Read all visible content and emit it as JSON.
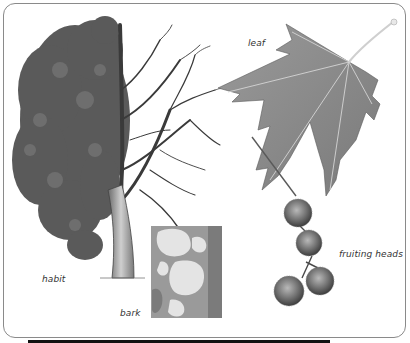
{
  "labels": {
    "habit": "habit",
    "bark": "bark",
    "leaf": "leaf",
    "fruiting_heads": "fruiting heads"
  },
  "colors": {
    "border": "#8a8a8a",
    "foliage": "#4a4a4a",
    "branches": "#3a3a3a",
    "leaf_fill": "#8c8c8c",
    "leaf_vein": "#dcdcdc",
    "bark_light": "#e6e6e6",
    "bark_dark": "#8f8f8f",
    "fruit": "#6e6e6e",
    "label_text": "#333333"
  }
}
